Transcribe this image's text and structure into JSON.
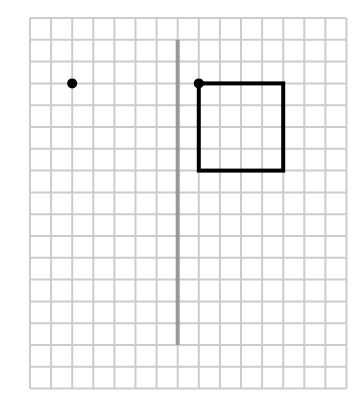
{
  "diagram": {
    "type": "reflection-grid",
    "grid": {
      "columns": 15,
      "rows": 17,
      "origin_x": 30,
      "origin_y": 18,
      "cell_w": 21.1,
      "cell_h": 21.8,
      "line_color": "#cccccc"
    },
    "mirror_line": {
      "grid_col": 7,
      "from_row": 1,
      "to_row": 15,
      "color": "#999999"
    },
    "square": {
      "col": 8,
      "row": 3,
      "width_cells": 4,
      "height_cells": 4,
      "color": "#000000"
    },
    "points": [
      {
        "name": "point-left",
        "col": 2,
        "row": 3,
        "color": "#000000"
      },
      {
        "name": "point-square-corner",
        "col": 8,
        "row": 3,
        "color": "#000000"
      }
    ]
  }
}
